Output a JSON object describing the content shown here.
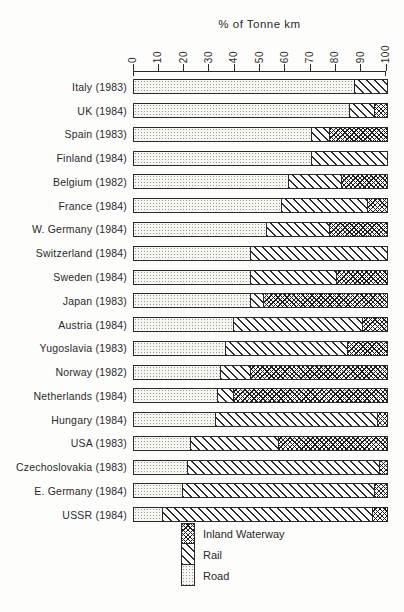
{
  "figure": {
    "title": "% of Tonne km",
    "legend": [
      {
        "label": "Inland Waterway",
        "pattern": "crosshatch"
      },
      {
        "label": "Rail",
        "pattern": "diagonal"
      },
      {
        "label": "Road",
        "pattern": "stipple"
      }
    ]
  },
  "chart_data": {
    "type": "bar",
    "orientation": "horizontal",
    "stacked": true,
    "title": "% of Tonne km",
    "xlabel": "% of Tonne km",
    "xlim": [
      0,
      100
    ],
    "x_ticks": [
      0,
      10,
      20,
      30,
      40,
      50,
      60,
      70,
      80,
      90,
      100
    ],
    "legend_position": "bottom",
    "grid": false,
    "categories": [
      "Italy (1983)",
      "UK (1984)",
      "Spain (1983)",
      "Finland (1984)",
      "Belgium (1982)",
      "France (1984)",
      "W. Germany (1984)",
      "Switzerland (1984)",
      "Sweden (1984)",
      "Japan (1983)",
      "Austria (1984)",
      "Yugoslavia (1983)",
      "Norway (1982)",
      "Netherlands (1984)",
      "Hungary (1984)",
      "USA (1983)",
      "Czechoslovakia (1983)",
      "E. Germany (1984)",
      "USSR (1984)"
    ],
    "series": [
      {
        "name": "Road",
        "pattern": "stipple",
        "values": [
          87,
          85,
          70,
          70,
          61,
          58,
          52,
          46,
          46,
          46,
          39,
          36,
          34,
          33,
          32,
          22,
          21,
          19,
          11
        ]
      },
      {
        "name": "Rail",
        "pattern": "diagonal",
        "values": [
          13,
          10,
          7,
          30,
          21,
          34,
          25,
          54,
          34,
          5,
          51,
          48,
          12,
          6,
          64,
          35,
          76,
          76,
          83
        ]
      },
      {
        "name": "Inland Waterway",
        "pattern": "crosshatch",
        "values": [
          0,
          5,
          23,
          0,
          18,
          8,
          23,
          0,
          20,
          49,
          10,
          16,
          54,
          61,
          4,
          43,
          3,
          5,
          6
        ]
      }
    ],
    "colors": {
      "ink": "#2a2a2a",
      "background": "#fdfdfb"
    }
  }
}
